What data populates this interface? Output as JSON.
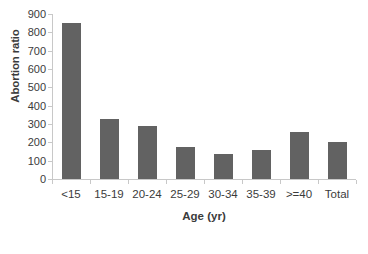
{
  "chart_data": {
    "type": "bar",
    "title": "",
    "subtitle": "",
    "xlabel": "Age (yr)",
    "ylabel": "Abortion ratio",
    "categories": [
      "<15",
      "15-19",
      "20-24",
      "25-29",
      "30-34",
      "35-39",
      ">=40",
      "Total"
    ],
    "values": [
      850,
      330,
      290,
      175,
      135,
      160,
      255,
      200
    ],
    "series": [
      {
        "name": "Abortion ratio",
        "values": [
          850,
          330,
          290,
          175,
          135,
          160,
          255,
          200
        ]
      }
    ],
    "ylim": [
      0,
      900
    ],
    "ytick_labels": [
      "900",
      "800",
      "700",
      "600",
      "500",
      "400",
      "300",
      "200",
      "100",
      "0"
    ],
    "ytick_values": [
      900,
      800,
      700,
      600,
      500,
      400,
      300,
      200,
      100,
      0
    ],
    "ytick_step": 100,
    "grid": false,
    "legend": false,
    "legend_position": "none",
    "bar_color": "#626262",
    "axis_color": "#c8c8c8",
    "text_color": "#3b3b3b",
    "background_color": "#ffffff"
  }
}
